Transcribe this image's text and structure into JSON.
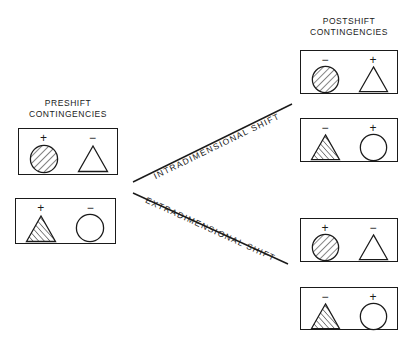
{
  "figure": {
    "preshift_title": "PRESHIFT\nCONTINGENCIES",
    "postshift_title": "POSTSHIFT\nCONTINGENCIES",
    "ink_color": "#1a1a1a",
    "background_color": "#ffffff"
  },
  "shift_labels": {
    "intradimensional": "INTRADIMENSIONAL SHIFT",
    "extradimensional": "EXTRADIMENSIONAL SHIFT"
  },
  "preshift_boxes": [
    {
      "id": "preshift-box-1",
      "left": {
        "sign": "+",
        "shape": "circle",
        "fill": "hatched"
      },
      "right": {
        "sign": "−",
        "shape": "triangle",
        "fill": "open"
      }
    },
    {
      "id": "preshift-box-2",
      "left": {
        "sign": "+",
        "shape": "triangle",
        "fill": "hatched"
      },
      "right": {
        "sign": "−",
        "shape": "circle",
        "fill": "open"
      }
    }
  ],
  "postshift_boxes": [
    {
      "id": "postshift-box-1",
      "left": {
        "sign": "−",
        "shape": "circle",
        "fill": "hatched"
      },
      "right": {
        "sign": "+",
        "shape": "triangle",
        "fill": "open"
      }
    },
    {
      "id": "postshift-box-2",
      "left": {
        "sign": "−",
        "shape": "triangle",
        "fill": "hatched"
      },
      "right": {
        "sign": "+",
        "shape": "circle",
        "fill": "open"
      }
    },
    {
      "id": "postshift-box-3",
      "left": {
        "sign": "+",
        "shape": "circle",
        "fill": "hatched"
      },
      "right": {
        "sign": "−",
        "shape": "triangle",
        "fill": "open"
      }
    },
    {
      "id": "postshift-box-4",
      "left": {
        "sign": "−",
        "shape": "triangle",
        "fill": "hatched"
      },
      "right": {
        "sign": "+",
        "shape": "circle",
        "fill": "open"
      }
    }
  ]
}
